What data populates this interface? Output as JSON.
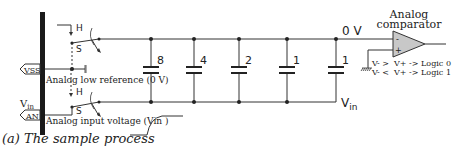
{
  "figure": {
    "caption": "(a) The sample process"
  },
  "pins": [
    {
      "label": "VSS",
      "description": "Analog low reference (0 V)"
    },
    {
      "label": "AN",
      "description": "Analog input voltage (Vin )",
      "side_label": "V",
      "side_label_sub": "in"
    }
  ],
  "switches": [
    {
      "hold_label": "H",
      "sample_label": "S"
    },
    {
      "hold_label": "H",
      "sample_label": "S"
    }
  ],
  "capacitors": [
    {
      "weight": "8"
    },
    {
      "weight": "4"
    },
    {
      "weight": "2"
    },
    {
      "weight": "1"
    },
    {
      "weight": "1"
    }
  ],
  "nodes": {
    "top_rail_label": "0 V",
    "bottom_rail_label": "V",
    "bottom_rail_label_sub": "in"
  },
  "comparator": {
    "title_line1": "Analog",
    "title_line2": "comparator",
    "minus": "-",
    "plus": "+",
    "rule1": "V- >  V+ -> Logic 0",
    "rule2": "V- <  V+ -> Logic 1"
  },
  "colors": {
    "line": "#333333",
    "bus_bar": "#1a1a1a",
    "comparator_fill": "#c8c8c8",
    "text": "#222222"
  }
}
